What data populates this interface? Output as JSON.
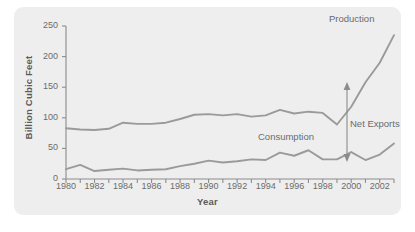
{
  "chart_data": {
    "type": "line",
    "title": "",
    "xlabel": "Year",
    "ylabel": "Billion Cubic Feet",
    "xlim": [
      1980,
      2003
    ],
    "ylim": [
      0,
      250
    ],
    "grid": false,
    "legend_position": "inline-annotations",
    "x": [
      1980,
      1981,
      1982,
      1983,
      1984,
      1985,
      1986,
      1987,
      1988,
      1989,
      1990,
      1991,
      1992,
      1993,
      1994,
      1995,
      1996,
      1997,
      1998,
      1999,
      2000,
      2001,
      2002,
      2003
    ],
    "xticks": [
      1980,
      1982,
      1984,
      1986,
      1988,
      1990,
      1992,
      1994,
      1996,
      1998,
      2000,
      2002
    ],
    "xtick_labels": [
      "1980",
      "1982",
      "1984",
      "1986",
      "1988",
      "1990",
      "1992",
      "1994",
      "1996",
      "1998",
      "2000",
      "2002"
    ],
    "yticks": [
      0,
      50,
      100,
      150,
      200,
      250
    ],
    "ytick_labels": [
      "0",
      "50",
      "100",
      "150",
      "200",
      "250"
    ],
    "series": [
      {
        "name": "Production",
        "color": "#9a9a9a",
        "values": [
          83,
          81,
          80,
          82,
          92,
          90,
          90,
          92,
          98,
          105,
          106,
          104,
          106,
          102,
          104,
          113,
          107,
          110,
          108,
          89,
          118,
          158,
          190,
          235
        ]
      },
      {
        "name": "Consumption",
        "color": "#9a9a9a",
        "values": [
          16,
          23,
          13,
          15,
          17,
          14,
          15,
          16,
          21,
          25,
          30,
          27,
          29,
          32,
          31,
          43,
          38,
          47,
          32,
          32,
          44,
          31,
          40,
          58
        ]
      }
    ],
    "annotations": [
      {
        "name": "production-label",
        "text": "Production"
      },
      {
        "name": "consumption-label",
        "text": "Consumption"
      },
      {
        "name": "net-exports-label",
        "text": "Net Exports"
      }
    ]
  },
  "colors": {
    "panel_background": "#eeeeee",
    "page_background": "#ffffff",
    "axis": "#8c8c8c",
    "line": "#9a9a9a",
    "text": "#6b6b6b",
    "axis_title_text": "#5a5a5a",
    "annotation_arrow": "#8c8c8c"
  }
}
